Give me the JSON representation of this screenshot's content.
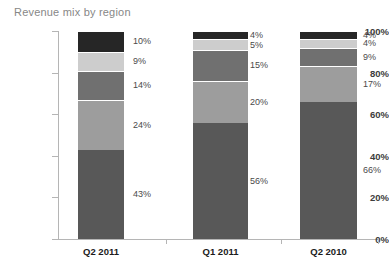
{
  "chart_data": {
    "type": "bar",
    "subtype": "stacked-percent-column",
    "title": "Revenue mix by region",
    "xlabel": "",
    "ylabel": "",
    "ylim": [
      0,
      100
    ],
    "yticks": [
      "0%",
      "20%",
      "40%",
      "60%",
      "80%",
      "100%"
    ],
    "ytick_values": [
      0,
      20,
      40,
      60,
      80,
      100
    ],
    "grid": false,
    "legend": "none",
    "categories": [
      "Q2 2011",
      "Q1 2011",
      "Q2 2010"
    ],
    "series": [
      {
        "name": "segment-1",
        "color": "#585858",
        "values": [
          43,
          56,
          66
        ],
        "labels": [
          "43%",
          "56%",
          "66%"
        ]
      },
      {
        "name": "segment-2",
        "color": "#9d9d9d",
        "values": [
          24,
          20,
          17
        ],
        "labels": [
          "24%",
          "20%",
          "17%"
        ]
      },
      {
        "name": "segment-3",
        "color": "#707070",
        "values": [
          14,
          15,
          9
        ],
        "labels": [
          "14%",
          "15%",
          "9%"
        ]
      },
      {
        "name": "segment-4",
        "color": "#cdcdcd",
        "values": [
          9,
          5,
          4
        ],
        "labels": [
          "9%",
          "5%",
          "4%"
        ]
      },
      {
        "name": "segment-5",
        "color": "#262626",
        "values": [
          10,
          4,
          4
        ],
        "labels": [
          "10%",
          "4%",
          "4%"
        ]
      }
    ],
    "axis_color": "#b5b5b5",
    "title_color": "#878787",
    "data_label_color": "#4a4a4a",
    "background": "#ffffff"
  }
}
